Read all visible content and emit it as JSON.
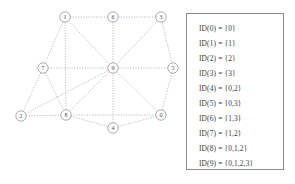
{
  "graph": {
    "nodes": [
      {
        "id": "1",
        "label": "1",
        "x": 65,
        "y": 17
      },
      {
        "id": "6",
        "label": "6",
        "x": 113,
        "y": 17
      },
      {
        "id": "3",
        "label": "3",
        "x": 161,
        "y": 17
      },
      {
        "id": "7",
        "label": "7",
        "x": 43,
        "y": 68
      },
      {
        "id": "9",
        "label": "9",
        "x": 113,
        "y": 68
      },
      {
        "id": "5",
        "label": "5",
        "x": 173,
        "y": 68
      },
      {
        "id": "2",
        "label": "2",
        "x": 21,
        "y": 116
      },
      {
        "id": "8",
        "label": "8",
        "x": 66,
        "y": 115
      },
      {
        "id": "0",
        "label": "0",
        "x": 161,
        "y": 115
      },
      {
        "id": "4",
        "label": "4",
        "x": 113,
        "y": 128
      }
    ],
    "edges": [
      [
        "1",
        "6"
      ],
      [
        "6",
        "3"
      ],
      [
        "1",
        "7"
      ],
      [
        "1",
        "9"
      ],
      [
        "1",
        "8"
      ],
      [
        "6",
        "9"
      ],
      [
        "3",
        "9"
      ],
      [
        "3",
        "5"
      ],
      [
        "5",
        "9"
      ],
      [
        "5",
        "0"
      ],
      [
        "7",
        "9"
      ],
      [
        "7",
        "2"
      ],
      [
        "7",
        "8"
      ],
      [
        "2",
        "8"
      ],
      [
        "2",
        "9"
      ],
      [
        "8",
        "9"
      ],
      [
        "8",
        "4"
      ],
      [
        "8",
        "0"
      ],
      [
        "4",
        "9"
      ],
      [
        "4",
        "0"
      ],
      [
        "0",
        "9"
      ]
    ],
    "node_radius": 5.2,
    "edge_color": "#9a9a9a",
    "node_stroke_color": "#8a8a8a",
    "node_fill_color": "#ffffff"
  },
  "legend": {
    "border_color": "#8d8d8d",
    "entries": [
      {
        "text": "ID(0) = {0}"
      },
      {
        "text": "ID(1) = {1}"
      },
      {
        "text": "ID(2) = {2}"
      },
      {
        "text": "ID(3) = {3}"
      },
      {
        "text": "ID(4) = {0,2}"
      },
      {
        "text": "ID(5) = {0,3}"
      },
      {
        "text": "ID(6) = {1,3}"
      },
      {
        "text": "ID(7) = {1,2}"
      },
      {
        "text": "ID(8) = {0,1,2}"
      },
      {
        "text": "ID(9) = {0,1,2,3}"
      }
    ]
  }
}
